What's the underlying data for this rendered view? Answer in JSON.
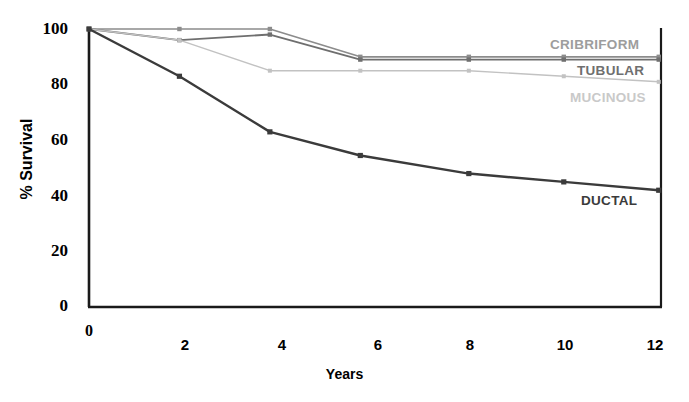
{
  "chart_data": {
    "type": "line",
    "title": "",
    "xlabel": "Years",
    "ylabel": "% Survival",
    "xlim": [
      0,
      12.65
    ],
    "ylim": [
      0,
      100
    ],
    "xticks": [
      0,
      2,
      4,
      6,
      8,
      10,
      12
    ],
    "yticks": [
      0,
      20,
      40,
      60,
      80,
      100
    ],
    "grid": false,
    "legend_position": "right-inline",
    "series": [
      {
        "name": "CRIBRIFORM",
        "color": "#8c8c8c",
        "label_color": "#9d9d9d",
        "x": [
          0,
          2,
          4,
          6,
          8.4,
          10.5,
          12.6
        ],
        "y": [
          100,
          100,
          100,
          90,
          90,
          90,
          90
        ]
      },
      {
        "name": "TUBULAR",
        "color": "#6f6f6f",
        "label_color": "#6f6f6f",
        "x": [
          0,
          2,
          4,
          6,
          8.4,
          10.5,
          12.6
        ],
        "y": [
          100,
          96,
          98,
          89,
          89,
          89,
          89
        ]
      },
      {
        "name": "MUCINOUS",
        "color": "#c2c2c2",
        "label_color": "#c9c9c9",
        "x": [
          0,
          2,
          4,
          6,
          8.4,
          10.5,
          12.6
        ],
        "y": [
          100,
          96,
          85,
          85,
          85,
          83,
          81
        ]
      },
      {
        "name": "DUCTAL",
        "color": "#3b3b3b",
        "label_color": "#3b3b3b",
        "x": [
          0,
          2,
          4,
          6,
          8.4,
          10.5,
          12.6
        ],
        "y": [
          100,
          83,
          63,
          54.5,
          48,
          45,
          42
        ]
      }
    ],
    "series_labels": [
      {
        "text": "CRIBRIFORM",
        "x_px": 550,
        "y_px": 37
      },
      {
        "text": "TUBULAR",
        "x_px": 577,
        "y_px": 63
      },
      {
        "text": "MUCINOUS",
        "x_px": 570,
        "y_px": 90
      },
      {
        "text": "DUCTAL",
        "x_px": 581,
        "y_px": 193
      }
    ]
  },
  "axes": {
    "y_title": "% Survival",
    "x_title": "Years",
    "y_ticks": [
      "0",
      "20",
      "40",
      "60",
      "80",
      "100"
    ],
    "x_ticks": [
      "0",
      "2",
      "4",
      "6",
      "8",
      "10",
      "12"
    ],
    "x_origin_label": "0"
  },
  "colors": {
    "axis": "#1a1a1a",
    "background": "#ffffff",
    "cribriform": "#8c8c8c",
    "tubular": "#6f6f6f",
    "mucinous": "#c2c2c2",
    "ductal": "#3b3b3b"
  }
}
